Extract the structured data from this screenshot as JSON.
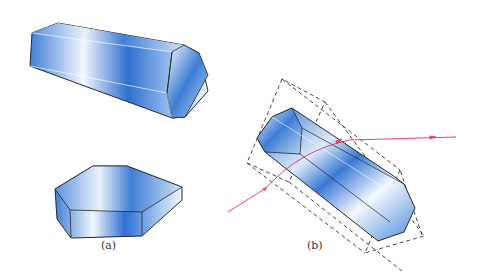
{
  "figure": {
    "panels": [
      {
        "label": "(a)",
        "description": "Two hexagonal crystal forms: elongated prism and flat hexagonal plate"
      },
      {
        "label": "(b)",
        "description": "Hexagonal prism crystal inside dashed bounding box with refracted light ray"
      }
    ],
    "colors": {
      "crystal_dark": "#2f6fd0",
      "crystal_light": "#e6f0fb",
      "outline": "#2a2a2a",
      "ray": "#e0447a",
      "dashed": "#333333"
    }
  }
}
